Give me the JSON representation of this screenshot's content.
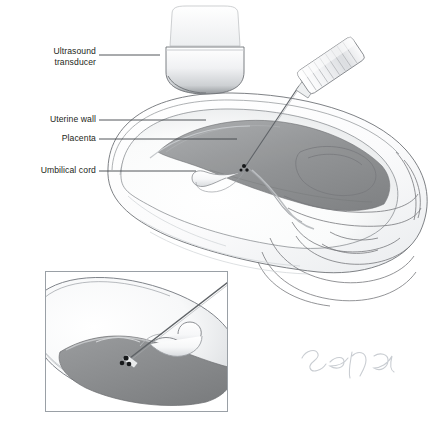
{
  "figure": {
    "background_color": "#ffffff",
    "signature": "sena",
    "signature_color": "#c9cdd2"
  },
  "labels": [
    {
      "id": "ultrasound-transducer",
      "text": "Ultrasound\ntransducer",
      "x": 12,
      "y": 46,
      "width": 84,
      "leader": {
        "x1": 99,
        "y1": 55,
        "x2": 160,
        "y2": 55
      }
    },
    {
      "id": "uterine-wall",
      "text": "Uterine wall",
      "x": 12,
      "y": 114,
      "width": 84,
      "leader": {
        "x1": 99,
        "y1": 120,
        "x2": 206,
        "y2": 120
      }
    },
    {
      "id": "placenta",
      "text": "Placenta",
      "x": 12,
      "y": 133,
      "width": 84,
      "leader": {
        "x1": 99,
        "y1": 139,
        "x2": 237,
        "y2": 139
      }
    },
    {
      "id": "umbilical-cord",
      "text": "Umbilical cord",
      "x": 8,
      "y": 165,
      "width": 88,
      "leader": {
        "x1": 99,
        "y1": 171,
        "x2": 196,
        "y2": 171
      }
    }
  ],
  "parts": {
    "transducer": {
      "name": "ultrasound-transducer",
      "color_light": "#fbfbfc",
      "color_dark": "#8f9296"
    },
    "syringe": {
      "name": "syringe-with-needle",
      "barrel_color": "#f2f3f5",
      "needle_color": "#5e6266"
    },
    "uterus": {
      "name": "uterus",
      "wall_color": "#f4f5f6",
      "outline_color": "#6f7377"
    },
    "placenta": {
      "name": "placenta",
      "color": "#8c8e90",
      "edge_color": "#6a6c6e"
    },
    "cord": {
      "name": "umbilical-cord",
      "color": "#fafbfc",
      "outline_color": "#8a8d91"
    },
    "vessels": {
      "name": "cord-vessels",
      "color": "#17191b",
      "count": 3
    },
    "cervix": {
      "name": "cervix-and-vagina",
      "outline_color": "#77797c"
    }
  },
  "inset": {
    "name": "magnified-detail",
    "frame": {
      "x": 45,
      "y": 271,
      "width": 183,
      "height": 141
    },
    "border_color": "#9aa0a6",
    "description": "Magnified view of needle entering umbilical cord vessel"
  },
  "chart_data": {
    "type": "diagram",
    "annotations": [
      "Ultrasound transducer",
      "Uterine wall",
      "Placenta",
      "Umbilical cord"
    ]
  }
}
